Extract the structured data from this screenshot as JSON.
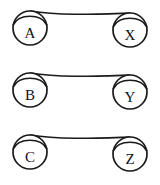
{
  "diagram": {
    "type": "node-pair-linkage",
    "background_color": "#ffffff",
    "stroke_color": "#1a1a1a",
    "label_color": "#111111",
    "node_radius": 17,
    "node_fill": "#ffffff",
    "rows": [
      {
        "id": "row-1",
        "left": {
          "label": "A",
          "cx": 30,
          "cy": 28
        },
        "right": {
          "label": "X",
          "cx": 130,
          "cy": 30
        },
        "link": {
          "from": "A",
          "to": "X",
          "path": "M 30 11 C 60 16, 100 14, 130 13"
        }
      },
      {
        "id": "row-2",
        "left": {
          "label": "B",
          "cx": 30,
          "cy": 90
        },
        "right": {
          "label": "Y",
          "cx": 130,
          "cy": 92
        },
        "link": {
          "from": "B",
          "to": "Y",
          "path": "M 30 73 C 60 78, 100 76, 130 75"
        }
      },
      {
        "id": "row-3",
        "left": {
          "label": "C",
          "cx": 30,
          "cy": 152
        },
        "right": {
          "label": "Z",
          "cx": 130,
          "cy": 154
        },
        "link": {
          "from": "C",
          "to": "Z",
          "path": "M 30 135 C 60 140, 100 138, 130 137"
        }
      }
    ]
  }
}
